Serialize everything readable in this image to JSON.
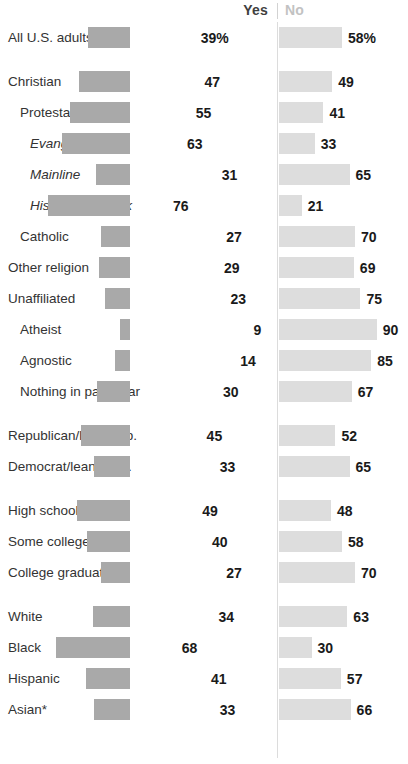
{
  "header": {
    "yes_label": "Yes",
    "no_label": "No"
  },
  "chart_data": {
    "type": "bar",
    "title": "",
    "subtitle": "",
    "xlabel": "",
    "ylabel": "",
    "orientation": "horizontal",
    "layout": "diverging-bar",
    "grid": false,
    "legend_position": "top",
    "value_suffix_first_row": "%",
    "axis_center_value": 0,
    "xlim": [
      0,
      100
    ],
    "series": [
      {
        "name": "Yes",
        "color": "#a9a9a9",
        "side": "left"
      },
      {
        "name": "No",
        "color": "#dddddd",
        "side": "right"
      }
    ],
    "categories": [
      "All U.S. adults",
      "Christian",
      "Protestant",
      "Evangelical",
      "Mainline",
      "Historically Black",
      "Catholic",
      "Other religion",
      "Unaffiliated",
      "Atheist",
      "Agnostic",
      "Nothing in particular",
      "Republican/lean Rep.",
      "Democrat/lean Dem.",
      "High school or less",
      "Some college",
      "College graduate",
      "White",
      "Black",
      "Hispanic",
      "Asian*"
    ],
    "rows": [
      {
        "label": "All U.S. adults",
        "indent": 0,
        "italic": false,
        "yes": 39,
        "no": 58,
        "yes_text": "39%",
        "no_text": "58%",
        "group": 0
      },
      {
        "label": "Christian",
        "indent": 0,
        "italic": false,
        "yes": 47,
        "no": 49,
        "yes_text": "47",
        "no_text": "49",
        "group": 1
      },
      {
        "label": "Protestant",
        "indent": 1,
        "italic": false,
        "yes": 55,
        "no": 41,
        "yes_text": "55",
        "no_text": "41",
        "group": 1
      },
      {
        "label": "Evangelical",
        "indent": 2,
        "italic": true,
        "yes": 63,
        "no": 33,
        "yes_text": "63",
        "no_text": "33",
        "group": 1
      },
      {
        "label": "Mainline",
        "indent": 2,
        "italic": true,
        "yes": 31,
        "no": 65,
        "yes_text": "31",
        "no_text": "65",
        "group": 1
      },
      {
        "label": "Historically Black",
        "indent": 2,
        "italic": true,
        "yes": 76,
        "no": 21,
        "yes_text": "76",
        "no_text": "21",
        "group": 1
      },
      {
        "label": "Catholic",
        "indent": 1,
        "italic": false,
        "yes": 27,
        "no": 70,
        "yes_text": "27",
        "no_text": "70",
        "group": 1
      },
      {
        "label": "Other religion",
        "indent": 0,
        "italic": false,
        "yes": 29,
        "no": 69,
        "yes_text": "29",
        "no_text": "69",
        "group": 1
      },
      {
        "label": "Unaffiliated",
        "indent": 0,
        "italic": false,
        "yes": 23,
        "no": 75,
        "yes_text": "23",
        "no_text": "75",
        "group": 1
      },
      {
        "label": "Atheist",
        "indent": 1,
        "italic": false,
        "yes": 9,
        "no": 90,
        "yes_text": "9",
        "no_text": "90",
        "group": 1
      },
      {
        "label": "Agnostic",
        "indent": 1,
        "italic": false,
        "yes": 14,
        "no": 85,
        "yes_text": "14",
        "no_text": "85",
        "group": 1
      },
      {
        "label": "Nothing in particular",
        "indent": 1,
        "italic": false,
        "yes": 30,
        "no": 67,
        "yes_text": "30",
        "no_text": "67",
        "group": 1
      },
      {
        "label": "Republican/lean Rep.",
        "indent": 0,
        "italic": false,
        "yes": 45,
        "no": 52,
        "yes_text": "45",
        "no_text": "52",
        "group": 2
      },
      {
        "label": "Democrat/lean Dem.",
        "indent": 0,
        "italic": false,
        "yes": 33,
        "no": 65,
        "yes_text": "33",
        "no_text": "65",
        "group": 2
      },
      {
        "label": "High school or less",
        "indent": 0,
        "italic": false,
        "yes": 49,
        "no": 48,
        "yes_text": "49",
        "no_text": "48",
        "group": 3
      },
      {
        "label": "Some college",
        "indent": 0,
        "italic": false,
        "yes": 40,
        "no": 58,
        "yes_text": "40",
        "no_text": "58",
        "group": 3
      },
      {
        "label": "College graduate",
        "indent": 0,
        "italic": false,
        "yes": 27,
        "no": 70,
        "yes_text": "27",
        "no_text": "70",
        "group": 3
      },
      {
        "label": "White",
        "indent": 0,
        "italic": false,
        "yes": 34,
        "no": 63,
        "yes_text": "34",
        "no_text": "63",
        "group": 4
      },
      {
        "label": "Black",
        "indent": 0,
        "italic": false,
        "yes": 68,
        "no": 30,
        "yes_text": "68",
        "no_text": "30",
        "group": 4
      },
      {
        "label": "Hispanic",
        "indent": 0,
        "italic": false,
        "yes": 41,
        "no": 57,
        "yes_text": "41",
        "no_text": "57",
        "group": 4
      },
      {
        "label": "Asian*",
        "indent": 0,
        "italic": false,
        "yes": 33,
        "no": 66,
        "yes_text": "33",
        "no_text": "66",
        "group": 4
      }
    ]
  },
  "colors": {
    "yes_bar": "#a9a9a9",
    "no_bar": "#dddddd",
    "text": "#333333",
    "value_text": "#1a1a1a",
    "no_header": "#c2c2c2",
    "divider": "#dcdcdc"
  }
}
